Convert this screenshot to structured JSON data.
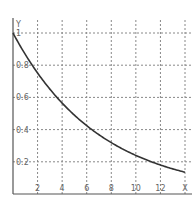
{
  "chart_data": {
    "type": "line",
    "title": "",
    "xlabel": "X",
    "ylabel": "Y",
    "xlim": [
      0,
      14
    ],
    "ylim": [
      0,
      1.0
    ],
    "x_ticks": [
      2,
      4,
      6,
      8,
      10,
      12
    ],
    "x_tick_labels": [
      "2",
      "4",
      "6",
      "8",
      "10",
      "12"
    ],
    "y_ticks": [
      0.2,
      0.4,
      0.6,
      0.8,
      1
    ],
    "y_tick_labels": [
      "0.2",
      "0.4",
      "0.6",
      "0.8",
      "1"
    ],
    "grid": true,
    "grid_style": "dashed",
    "legend": null,
    "series": [
      {
        "name": "y = e^(-x/7)",
        "x": [
          0,
          1,
          2,
          3,
          4,
          5,
          6,
          7,
          8,
          9,
          10,
          11,
          12,
          13,
          14
        ],
        "y": [
          1.0,
          0.867,
          0.751,
          0.651,
          0.565,
          0.49,
          0.424,
          0.368,
          0.319,
          0.276,
          0.24,
          0.208,
          0.18,
          0.156,
          0.135
        ]
      }
    ],
    "colors": {
      "curve": "#333333",
      "axis": "#555555",
      "grid": "#888888"
    }
  }
}
